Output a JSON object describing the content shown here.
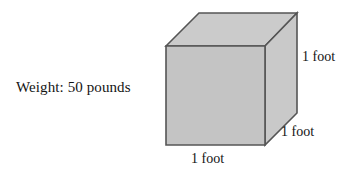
{
  "figure": {
    "type": "cube-diagram",
    "background_color": "#ffffff",
    "shape": {
      "name": "cube",
      "front_face_color": "#c4c4c4",
      "top_face_color": "#cbcbcb",
      "right_face_color": "#c9c9c9",
      "outline_color": "#555555",
      "outline_width": 1.6,
      "front_face": {
        "left": 166,
        "top": 46,
        "right": 265,
        "bottom": 145
      },
      "depth_offset": {
        "dx": 33,
        "dy": -33
      },
      "vertices": {
        "front_top_left": [
          166,
          46
        ],
        "front_top_right": [
          265,
          46
        ],
        "front_bottom_right": [
          265,
          145
        ],
        "front_bottom_left": [
          166,
          145
        ],
        "back_top_left": [
          199,
          13
        ],
        "back_top_right": [
          297,
          13
        ],
        "back_bottom_right": [
          297,
          113
        ]
      }
    }
  },
  "labels": {
    "weight": "Weight: 50 pounds",
    "height_dimension": "1 foot",
    "depth_dimension": "1 foot",
    "width_dimension": "1 foot"
  },
  "values": {
    "weight_number": "50",
    "weight_unit": "pounds",
    "edge_length": "1",
    "edge_unit": "foot"
  }
}
